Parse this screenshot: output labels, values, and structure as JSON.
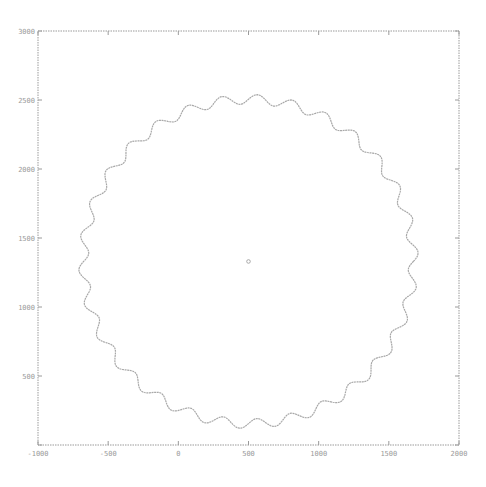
{
  "chart_data": {
    "type": "line",
    "title": "",
    "xlabel": "",
    "ylabel": "",
    "xlim": [
      -1000,
      2000
    ],
    "ylim": [
      0,
      3000
    ],
    "grid": false,
    "legend": null,
    "x_ticks": [
      -1000,
      -500,
      0,
      500,
      1000,
      1500,
      2000
    ],
    "y_ticks": [
      0,
      500,
      1000,
      1500,
      2000,
      2500,
      3000
    ],
    "x_tick_labels": [
      "-1000",
      "-500",
      "0",
      "500",
      "1000",
      "1500",
      "2000"
    ],
    "y_tick_labels": [
      "",
      "500",
      "1000",
      "1500",
      "2000",
      "2500",
      "3000"
    ],
    "series": [
      {
        "name": "wavy-ring",
        "kind": "parametric-curve",
        "center": [
          500,
          1330
        ],
        "radius": 1175,
        "wave_amplitude": 35,
        "wave_count": 30,
        "color": "#a8a8a8"
      },
      {
        "name": "center-point",
        "kind": "point",
        "x": [
          500
        ],
        "y": [
          1330
        ],
        "color": "#a8a8a8"
      }
    ]
  },
  "style": {
    "axis_color": "#9a9a9a",
    "curve_color": "#a8a8a8",
    "background": "#ffffff"
  },
  "layout": {
    "plot_left": 38,
    "plot_top": 31,
    "plot_right": 459,
    "plot_bottom": 445
  }
}
